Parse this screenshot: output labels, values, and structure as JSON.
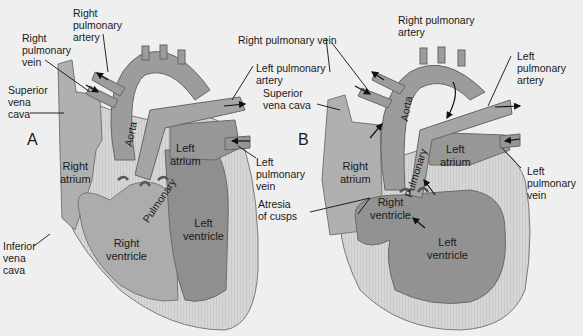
{
  "colors": {
    "background": "#efefef",
    "myocardium": "#d2d2d2",
    "chamber_light": "#aaaaaa",
    "chamber_dark": "#8f8f8f",
    "vessel": "#9a9a9a",
    "outline": "#6e6e6e",
    "text": "#1a1a1a"
  },
  "panel_a": {
    "letter": "A",
    "labels": {
      "right_pulmonary_artery": "Right\npulmonary\nartery",
      "right_pulmonary_vein": "Right\npulmonary\nvein",
      "superior_vena_cava": "Superior\nvena\ncava",
      "left_pulmonary_artery": "Left pulmonary\nartery",
      "left_pulmonary_vein": "Left\npulmonary\nvein",
      "inferior_vena_cava": "Inferior\nvena\ncava"
    },
    "inner": {
      "aorta": "Aorta",
      "pulmonary": "Pulmonary",
      "right_atrium": "Right\natrium",
      "left_atrium": "Left\natrium",
      "right_ventricle": "Right\nventricle",
      "left_ventricle": "Left\nventricle"
    }
  },
  "panel_b": {
    "letter": "B",
    "labels": {
      "right_pulmonary_vein": "Right pulmonary vein",
      "right_pulmonary_artery": "Right pulmonary\nartery",
      "superior_vena_cava": "Superior\nvena cava",
      "left_pulmonary_artery": "Left\npulmonary\nartery",
      "left_pulmonary_vein": "Left\npulmonary\nvein",
      "atresia_of_cusps": "Atresia\nof cusps"
    },
    "inner": {
      "aorta": "Aorta",
      "pulmonary": "Pulmonary",
      "right_atrium": "Right\natrium",
      "left_atrium": "Left\natrium",
      "right_ventricle": "Right\nventricle",
      "left_ventricle": "Left\nventricle"
    }
  }
}
